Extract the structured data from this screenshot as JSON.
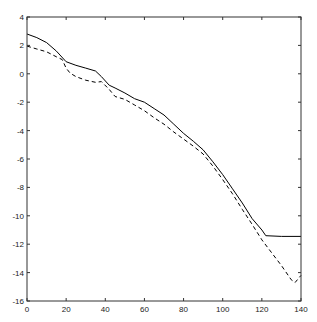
{
  "chart_data": {
    "type": "line",
    "title": "",
    "xlabel": "",
    "ylabel": "",
    "xlim": [
      0,
      140
    ],
    "ylim": [
      -16,
      4
    ],
    "grid": false,
    "legend": null,
    "xticks": [
      0,
      20,
      40,
      60,
      80,
      100,
      120,
      140
    ],
    "yticks": [
      4,
      2,
      0,
      -2,
      -4,
      -6,
      -8,
      -10,
      -12,
      -14,
      -16
    ],
    "series": [
      {
        "name": "solid",
        "style": "solid",
        "color": "#000000",
        "x": [
          0,
          5,
          10,
          15,
          20,
          25,
          30,
          35,
          38,
          42,
          45,
          50,
          55,
          60,
          65,
          70,
          75,
          80,
          85,
          90,
          95,
          100,
          105,
          110,
          115,
          120,
          122,
          130,
          140
        ],
        "y": [
          2.8,
          2.55,
          2.2,
          1.6,
          0.85,
          0.6,
          0.4,
          0.2,
          -0.2,
          -0.8,
          -1.0,
          -1.35,
          -1.75,
          -2.0,
          -2.45,
          -2.9,
          -3.55,
          -4.2,
          -4.75,
          -5.35,
          -6.2,
          -7.1,
          -8.1,
          -9.1,
          -10.2,
          -11.0,
          -11.4,
          -11.45,
          -11.45
        ]
      },
      {
        "name": "dashed",
        "style": "dashed",
        "color": "#000000",
        "x": [
          0,
          5,
          10,
          15,
          18,
          20,
          22,
          25,
          30,
          35,
          38,
          42,
          45,
          50,
          55,
          60,
          65,
          70,
          75,
          80,
          85,
          90,
          95,
          100,
          105,
          110,
          115,
          120,
          125,
          130,
          135,
          137,
          140
        ],
        "y": [
          1.95,
          1.75,
          1.55,
          1.2,
          1.0,
          0.4,
          0.05,
          -0.2,
          -0.45,
          -0.6,
          -0.55,
          -1.1,
          -1.6,
          -1.8,
          -2.2,
          -2.6,
          -3.1,
          -3.55,
          -4.1,
          -4.6,
          -5.1,
          -5.65,
          -6.5,
          -7.45,
          -8.45,
          -9.55,
          -10.6,
          -11.7,
          -12.6,
          -13.5,
          -14.5,
          -14.7,
          -14.2
        ]
      }
    ]
  },
  "layout": {
    "plot_left": 27,
    "plot_right": 301,
    "plot_top": 17,
    "plot_bottom": 301
  }
}
